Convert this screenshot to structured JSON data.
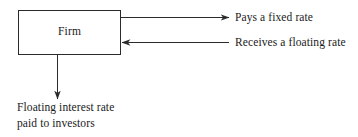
{
  "diagram": {
    "type": "flow-diagram",
    "background_color": "#ffffff",
    "stroke_color": "#2b2b2b",
    "text_color": "#1a1a1a",
    "node": {
      "label": "Firm"
    },
    "edges": [
      {
        "name": "pays-fixed-rate",
        "label": "Pays a fixed rate",
        "direction": "outgoing-right"
      },
      {
        "name": "receives-floating-rate",
        "label": "Receives a floating rate",
        "direction": "incoming-left"
      },
      {
        "name": "floating-interest-to-investors",
        "label_line1": "Floating interest rate",
        "label_line2": "paid to investors",
        "direction": "outgoing-down"
      }
    ]
  }
}
